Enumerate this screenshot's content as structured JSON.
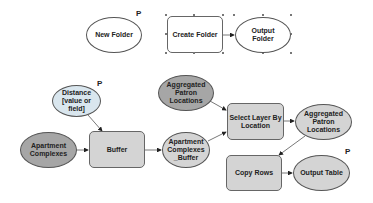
{
  "diagram": {
    "nodes": [
      {
        "id": "new-folder",
        "label": "New Folder",
        "shape": "ellipse",
        "fill": "#ffffff",
        "parameter": true
      },
      {
        "id": "create-folder",
        "label": "Create Folder",
        "shape": "rect",
        "fill": "#ffffff",
        "selected": true
      },
      {
        "id": "output-folder",
        "label": "Output\nFolder",
        "shape": "ellipse",
        "fill": "#ffffff"
      },
      {
        "id": "distance",
        "label": "Distance\n[value or\nfield]",
        "shape": "ellipse",
        "fill": "#d9e6ee",
        "parameter": true
      },
      {
        "id": "apartment-complexes",
        "label": "Apartment\nComplexes",
        "shape": "ellipse",
        "fill": "#a6a6a6"
      },
      {
        "id": "buffer",
        "label": "Buffer",
        "shape": "rect",
        "fill": "#d4d4d4"
      },
      {
        "id": "apartment-complexes-buffer",
        "label": "Apartment\nComplexes\n_Buffer",
        "shape": "ellipse",
        "fill": "#d4d4d4"
      },
      {
        "id": "aggregated-patron-locations-in",
        "label": "Aggregated\nPatron\nLocations",
        "shape": "ellipse",
        "fill": "#a6a6a6"
      },
      {
        "id": "select-layer-by-location",
        "label": "Select Layer By\nLocation",
        "shape": "rect",
        "fill": "#d4d4d4"
      },
      {
        "id": "aggregated-patron-locations-out",
        "label": "Aggregated\nPatron\nLocations",
        "shape": "ellipse",
        "fill": "#d4d4d4"
      },
      {
        "id": "copy-rows",
        "label": "Copy Rows",
        "shape": "rect",
        "fill": "#d4d4d4"
      },
      {
        "id": "output-table",
        "label": "Output Table",
        "shape": "ellipse",
        "fill": "#d4d4d4",
        "parameter": true
      }
    ],
    "edges": [
      {
        "from": "create-folder",
        "to": "output-folder"
      },
      {
        "from": "distance",
        "to": "buffer"
      },
      {
        "from": "apartment-complexes",
        "to": "buffer"
      },
      {
        "from": "buffer",
        "to": "apartment-complexes-buffer"
      },
      {
        "from": "aggregated-patron-locations-in",
        "to": "select-layer-by-location"
      },
      {
        "from": "apartment-complexes-buffer",
        "to": "select-layer-by-location"
      },
      {
        "from": "select-layer-by-location",
        "to": "aggregated-patron-locations-out"
      },
      {
        "from": "aggregated-patron-locations-out",
        "to": "copy-rows"
      },
      {
        "from": "copy-rows",
        "to": "output-table"
      }
    ],
    "parameter_marker": "P"
  }
}
